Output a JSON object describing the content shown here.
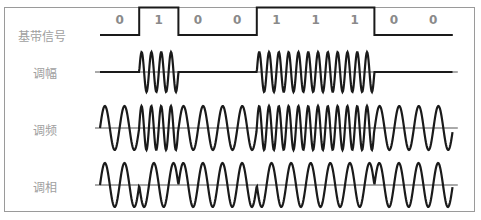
{
  "diagram": {
    "rows": [
      {
        "id": "baseband",
        "label": "基带信号"
      },
      {
        "id": "am",
        "label": "调幅"
      },
      {
        "id": "fm",
        "label": "调频"
      },
      {
        "id": "pm",
        "label": "调相"
      }
    ],
    "bits": [
      "0",
      "1",
      "0",
      "0",
      "1",
      "1",
      "1",
      "0",
      "0"
    ],
    "colors": {
      "waveform": "#1a1a1a",
      "axis": "#555555",
      "label": "#a0a0a0",
      "bit_text": "#8a8a8a",
      "frame": "#9a9a9a"
    }
  }
}
